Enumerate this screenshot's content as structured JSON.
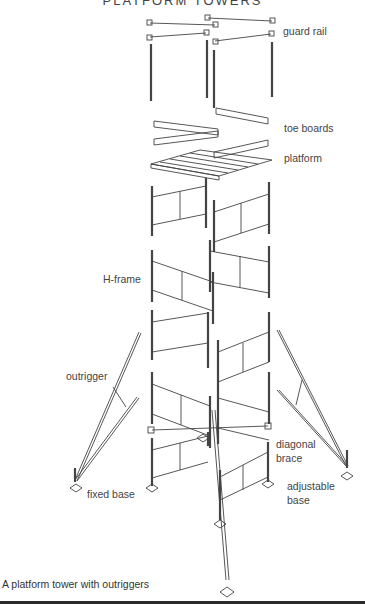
{
  "title": "PLATFORM TOWERS",
  "labels": {
    "guard_rail": "guard rail",
    "toe_boards": "toe boards",
    "platform": "platform",
    "h_frame": "H-frame",
    "outrigger": "outrigger",
    "fixed_base": "fixed base",
    "diagonal_brace_1": "diagonal",
    "diagonal_brace_2": "brace",
    "adjustable_base_1": "adjustable",
    "adjustable_base_2": "base"
  },
  "caption": "A platform tower with outriggers",
  "colors": {
    "line": "#444444",
    "background": "#ffffff",
    "bottom_band": "#2b2b2b"
  }
}
